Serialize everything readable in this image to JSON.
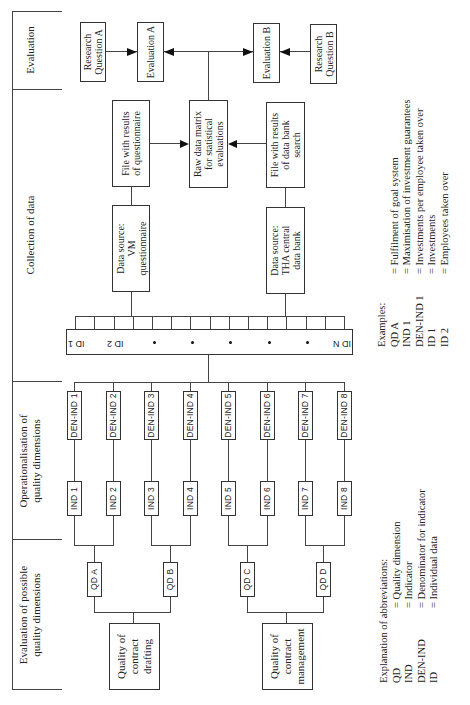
{
  "headers": [
    {
      "id": "eval-possible",
      "label": "Evaluation of possible quality dimensions"
    },
    {
      "id": "operationalisation",
      "label": "Operationalisation of quality dimensions"
    },
    {
      "id": "collection",
      "label": "Collection of data"
    },
    {
      "id": "evaluation",
      "label": "Evaluation"
    }
  ],
  "quality_areas": [
    {
      "label": "Quality of contract drafting"
    },
    {
      "label": "Quality of contract management"
    }
  ],
  "quality_dimensions": [
    "QD A",
    "QD B",
    "QD C",
    "QD D"
  ],
  "indicators": [
    "IND 1",
    "IND 2",
    "IND 3",
    "IND 4",
    "IND 5",
    "IND 6",
    "IND 7",
    "IND 8"
  ],
  "denominators": [
    "DEN-IND 1",
    "DEN-IND 2",
    "DEN-IND 3",
    "DEN-IND 4",
    "DEN-IND 5",
    "DEN-IND 6",
    "DEN-IND 7",
    "DEN-IND 8"
  ],
  "id_bar": {
    "labels": [
      "ID 1",
      "ID 2",
      "*",
      "*",
      "*",
      "*",
      "*",
      "ID N"
    ]
  },
  "collection": {
    "source_vm": "Data source: VM questionnaire",
    "source_tha": "Data source: THA central data bank",
    "file_vm": "File with results of questionnaire",
    "file_tha": "File with results of data bank search",
    "raw_matrix": "Raw data matrix for statistical evaluations"
  },
  "evaluation": {
    "eval_a": "Evaluation A",
    "eval_b": "Evaluation B",
    "rq_a": "Research Question A",
    "rq_b": "Research Question B"
  },
  "abbreviations": {
    "title": "Explanation of abbreviations:",
    "items": [
      {
        "abbr": "QD",
        "meaning": "= Quality dimension"
      },
      {
        "abbr": "IND",
        "meaning": "= Indicator"
      },
      {
        "abbr": "DEN-IND",
        "meaning": "= Denominator for indicator"
      },
      {
        "abbr": "ID",
        "meaning": "= Individual data"
      }
    ]
  },
  "examples": {
    "title": "Examples:",
    "items": [
      {
        "abbr": "QD A",
        "meaning": "= Fulfilment of goal system"
      },
      {
        "abbr": "IND 1",
        "meaning": "= Maximisation of investment guarantees"
      },
      {
        "abbr": "DEN-IND 1",
        "meaning": "= Investments per employee taken over"
      },
      {
        "abbr": "ID 1",
        "meaning": "= Investments"
      },
      {
        "abbr": "ID 2",
        "meaning": "= Employees taken over"
      }
    ]
  }
}
